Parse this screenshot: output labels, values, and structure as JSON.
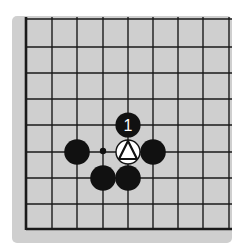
{
  "diagram": {
    "type": "go-board-fragment",
    "grid": {
      "columns_x": [
        26,
        52,
        77,
        103,
        128,
        153,
        178,
        203,
        229
      ],
      "rows_y": [
        19,
        47,
        73,
        99,
        125,
        152,
        178,
        204,
        229
      ],
      "left_edge": true,
      "bottom_edge": true,
      "top_edge": false,
      "right_edge": false
    },
    "colors": {
      "board": "#cfcfcf",
      "line": "#1a1a1a",
      "black_stone": "#111111",
      "white_stone": "#ffffff"
    },
    "stones": [
      {
        "color": "black",
        "col": 4,
        "row": 4,
        "label": "1"
      },
      {
        "color": "white",
        "col": 4,
        "row": 5,
        "label": "",
        "marker": "triangle"
      },
      {
        "color": "black",
        "col": 2,
        "row": 5,
        "label": ""
      },
      {
        "color": "black",
        "col": 5,
        "row": 5,
        "label": ""
      },
      {
        "color": "black",
        "col": 3,
        "row": 6,
        "label": ""
      },
      {
        "color": "black",
        "col": 4,
        "row": 6,
        "label": ""
      }
    ],
    "points": [
      {
        "type": "small-dot",
        "col": 3,
        "row": 5
      }
    ],
    "move_label": "1"
  }
}
